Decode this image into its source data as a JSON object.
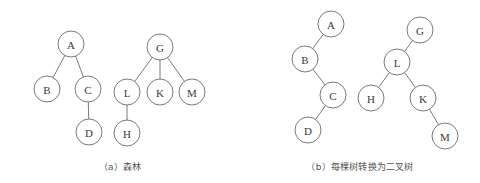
{
  "figure": {
    "background_color": "#ffffff",
    "stroke_color": "#6b6b6b",
    "label_color": "#3a3a3a",
    "caption_color": "#555555",
    "node_radius": 13
  },
  "panels": [
    {
      "id": "panel-a",
      "caption": "（a）森林",
      "trees": [
        {
          "id": "tree-a-forest-1",
          "root": "A",
          "nodes": [
            {
              "label": "A",
              "x": 71,
              "y": 44
            },
            {
              "label": "B",
              "x": 47,
              "y": 89
            },
            {
              "label": "C",
              "x": 88,
              "y": 89
            },
            {
              "label": "D",
              "x": 89,
              "y": 132
            }
          ],
          "edges": [
            {
              "from": "A",
              "to": "B"
            },
            {
              "from": "A",
              "to": "C"
            },
            {
              "from": "C",
              "to": "D"
            }
          ]
        },
        {
          "id": "tree-a-forest-2",
          "root": "G",
          "nodes": [
            {
              "label": "G",
              "x": 160,
              "y": 47
            },
            {
              "label": "L",
              "x": 127,
              "y": 92
            },
            {
              "label": "K",
              "x": 160,
              "y": 92
            },
            {
              "label": "M",
              "x": 192,
              "y": 92
            },
            {
              "label": "H",
              "x": 127,
              "y": 133
            }
          ],
          "edges": [
            {
              "from": "G",
              "to": "L"
            },
            {
              "from": "G",
              "to": "K"
            },
            {
              "from": "G",
              "to": "M"
            },
            {
              "from": "L",
              "to": "H"
            }
          ]
        }
      ]
    },
    {
      "id": "panel-b",
      "caption": "（b）每棵树转换为二叉树",
      "trees": [
        {
          "id": "tree-b-binary-1",
          "root": "A",
          "nodes": [
            {
              "label": "A",
              "x": 331,
              "y": 24
            },
            {
              "label": "B",
              "x": 305,
              "y": 59
            },
            {
              "label": "C",
              "x": 333,
              "y": 95
            },
            {
              "label": "D",
              "x": 308,
              "y": 130
            }
          ],
          "edges": [
            {
              "from": "A",
              "to": "B"
            },
            {
              "from": "B",
              "to": "C"
            },
            {
              "from": "C",
              "to": "D"
            }
          ]
        },
        {
          "id": "tree-b-binary-2",
          "root": "G",
          "nodes": [
            {
              "label": "G",
              "x": 420,
              "y": 30
            },
            {
              "label": "L",
              "x": 397,
              "y": 62
            },
            {
              "label": "H",
              "x": 371,
              "y": 98
            },
            {
              "label": "K",
              "x": 423,
              "y": 98
            },
            {
              "label": "M",
              "x": 445,
              "y": 136
            }
          ],
          "edges": [
            {
              "from": "G",
              "to": "L"
            },
            {
              "from": "L",
              "to": "H"
            },
            {
              "from": "L",
              "to": "K"
            },
            {
              "from": "K",
              "to": "M"
            }
          ]
        }
      ]
    }
  ]
}
